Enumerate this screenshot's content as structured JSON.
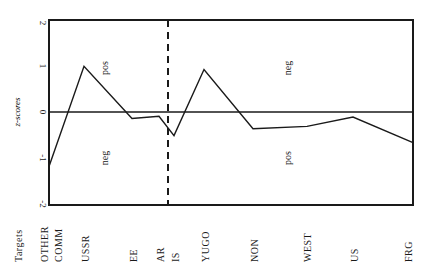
{
  "chart_data": {
    "type": "line",
    "title": "",
    "xlabel": "Targets",
    "ylabel": "z-scores",
    "ylim": [
      -2,
      2
    ],
    "yticks": [
      "2",
      "1",
      "0",
      "-1",
      "-2"
    ],
    "categories": [
      "OTHER COMM",
      "USSR",
      "EE",
      "AR",
      "IS",
      "YUGO",
      "NON",
      "WEST",
      "US",
      "FRG"
    ],
    "series": [
      {
        "name": "z-scores",
        "values": [
          -1.17,
          1.0,
          -0.13,
          -0.08,
          -0.5,
          0.93,
          -0.35,
          -0.3,
          -0.1,
          -0.65
        ]
      }
    ],
    "annotations": [
      {
        "text": "pos",
        "region": "left-upper"
      },
      {
        "text": "neg",
        "region": "left-lower"
      },
      {
        "text": "neg",
        "region": "right-upper"
      },
      {
        "text": "pos",
        "region": "right-lower"
      }
    ],
    "divider": {
      "style": "dashed",
      "between": [
        "AR",
        "IS"
      ]
    },
    "grid": false,
    "zero_line": true
  },
  "labels": {
    "xlabel": "Targets",
    "ylabel": "z-scores",
    "ytick_2": "2",
    "ytick_1": "1",
    "ytick_0": "0",
    "ytick_m1": "-1",
    "ytick_m2": "-2",
    "ann_pos_left": "pos",
    "ann_neg_left": "neg",
    "ann_neg_right": "neg",
    "ann_pos_right": "pos",
    "cat_other": "OTHER",
    "cat_comm": "COMM",
    "cat_ussr": "USSR",
    "cat_ee": "EE",
    "cat_ar": "AR",
    "cat_is": "IS",
    "cat_yugo": "YUGO",
    "cat_non": "NON",
    "cat_west": "WEST",
    "cat_us": "US",
    "cat_frg": "FRG"
  }
}
